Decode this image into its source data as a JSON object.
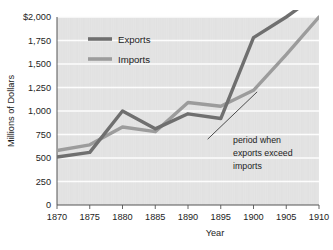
{
  "chart_data": {
    "type": "line",
    "title": "",
    "xlabel": "Year",
    "ylabel": "Millions of Dollars",
    "x": [
      1870,
      1875,
      1880,
      1885,
      1890,
      1895,
      1900,
      1905,
      1910
    ],
    "xlim": [
      1870,
      1910
    ],
    "ylim": [
      0,
      2000
    ],
    "grid": "horizontal",
    "legend_position": "top-left-inside",
    "series": [
      {
        "name": "Exports",
        "color": "#6f6f6f",
        "values": [
          510,
          560,
          1000,
          810,
          970,
          920,
          1780,
          2000,
          2250
        ]
      },
      {
        "name": "Imports",
        "color": "#9c9c9c",
        "values": [
          580,
          640,
          830,
          780,
          1090,
          1050,
          1220,
          1600,
          2000
        ]
      }
    ],
    "x_tick_labels": [
      "1870",
      "1875",
      "1880",
      "1885",
      "1890",
      "1895",
      "1900",
      "1905",
      "1910"
    ],
    "y_tick_values": [
      0,
      250,
      500,
      750,
      1000,
      1250,
      1500,
      1750,
      2000
    ],
    "y_tick_labels": [
      "0",
      "250",
      "500",
      "750",
      "1,000",
      "1,250",
      "1,500",
      "1,750",
      "$2,000"
    ],
    "annotations": [
      {
        "text_lines": [
          "period when",
          "exports exceed",
          "imports"
        ],
        "leader_from_x": 1893.0,
        "leader_from_y": 700,
        "leader_to_x": 1897.5,
        "leader_to_y": 810
      }
    ],
    "plot_background": "#e4e4e4",
    "axis_color": "#555555",
    "gridline_color": "#fdfdfd"
  },
  "legend": {
    "items": [
      {
        "label": "Exports",
        "color": "#6f6f6f"
      },
      {
        "label": "Imports",
        "color": "#9c9c9c"
      }
    ]
  },
  "annotation": {
    "line1": "period when",
    "line2": "exports exceed",
    "line3": "imports"
  },
  "axes": {
    "y_title": "Millions of Dollars",
    "x_title": "Year"
  }
}
